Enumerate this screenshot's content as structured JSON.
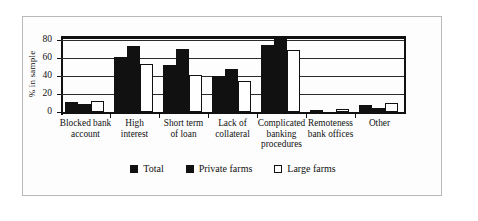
{
  "chart_data": {
    "type": "bar",
    "title": "",
    "xlabel": "",
    "ylabel": "% in sample",
    "ylim": [
      0,
      85
    ],
    "yticks": [
      0,
      20,
      40,
      60,
      80
    ],
    "grid": true,
    "legend_position": "bottom",
    "categories": [
      "Blocked bank account",
      "High interest",
      "Short term of loan",
      "Lack of collateral",
      "Complicated banking procedures",
      "Remoteness bank offices",
      "Other"
    ],
    "category_lines": [
      [
        "Blocked bank",
        "account"
      ],
      [
        "High",
        "interest"
      ],
      [
        "Short term",
        "of loan"
      ],
      [
        "Lack of",
        "collateral"
      ],
      [
        "Complicated",
        "banking",
        "procedures"
      ],
      [
        "Remoteness",
        "bank offices"
      ],
      [
        "Other"
      ]
    ],
    "series": [
      {
        "name": "Total",
        "style": "filled",
        "values": [
          11,
          62,
          53,
          40,
          75,
          2,
          8
        ]
      },
      {
        "name": "Private farms",
        "style": "filled",
        "values": [
          9,
          74,
          70,
          48,
          83,
          0,
          5
        ]
      },
      {
        "name": "Large farms",
        "style": "open",
        "values": [
          12,
          54,
          41,
          35,
          69,
          3,
          10
        ]
      }
    ]
  },
  "legend": {
    "items": [
      {
        "label": "Total",
        "style": "filled"
      },
      {
        "label": "Private farms",
        "style": "filled"
      },
      {
        "label": "Large farms",
        "style": "open"
      }
    ]
  },
  "colors": {
    "filled": "#111111",
    "open": "#ffffff",
    "outline": "#111111",
    "grid": "#2b2b2b",
    "frame": "#b9b9b9"
  }
}
